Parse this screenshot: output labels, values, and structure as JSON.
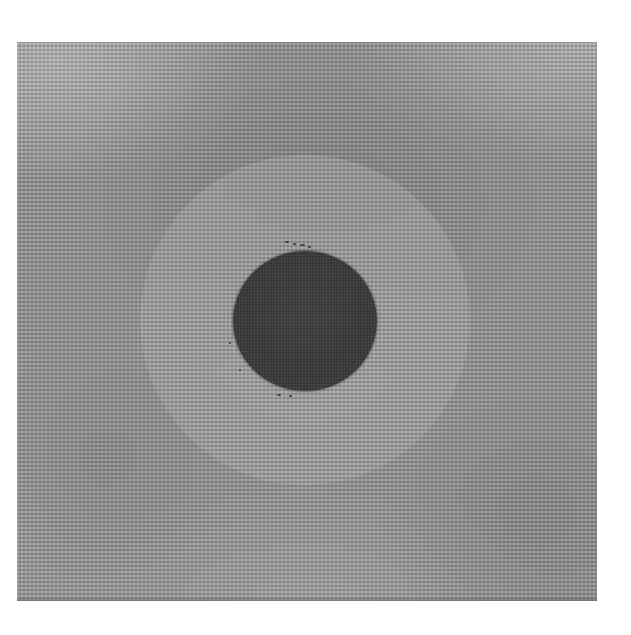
{
  "image": {
    "description": "Grayscale photo of a square woven fabric swatch with a dark circular disc at center surrounded by a lighter circular halo zone",
    "background_color": "#ffffff",
    "swatch": {
      "base_color": "#939393",
      "light_tone": "#b4b4b4",
      "dark_tone": "#6e6e6e"
    },
    "disc": {
      "color": "#383838",
      "center": [
        305,
        321
      ],
      "radius": 71
    },
    "halo": {
      "color": "#aaaaaa",
      "center": [
        305,
        320
      ],
      "radius": 165
    }
  }
}
